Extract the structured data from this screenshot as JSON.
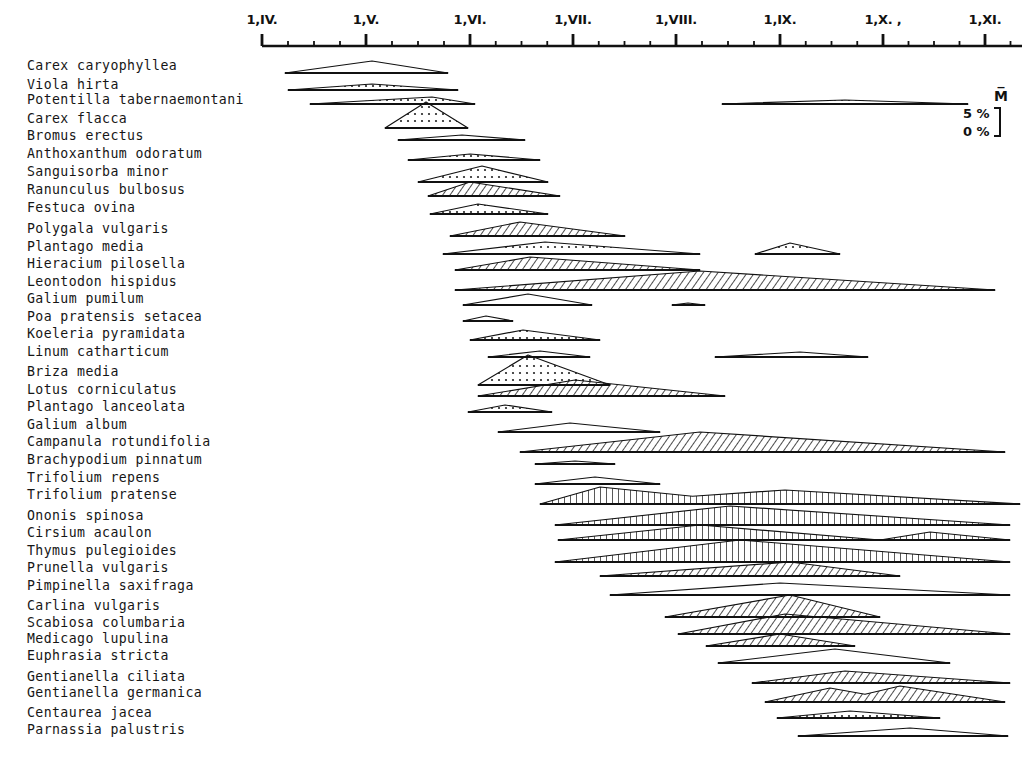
{
  "figure": {
    "kind": "phenology-diagram",
    "axis": {
      "orientation": "horizontal-top",
      "ticks_major": [
        {
          "label": "1,IV.",
          "x": 262
        },
        {
          "label": "1,V.",
          "x": 366
        },
        {
          "label": "1,VI.",
          "x": 470
        },
        {
          "label": "1,VII.",
          "x": 573
        },
        {
          "label": "1,VIII.",
          "x": 676
        },
        {
          "label": "1,IX.",
          "x": 780
        },
        {
          "label": "1,X. ,",
          "x": 883
        },
        {
          "label": "1,XI.",
          "x": 985
        }
      ],
      "minor_ticks_per_month": 3,
      "line_start_x": 262,
      "line_end_x": 1022,
      "line_y": 46
    },
    "legend": {
      "mean_symbol": "M̅",
      "upper_label": "5 %",
      "lower_label": "0 %",
      "bracket_x": 1000,
      "bracket_top": 108,
      "bracket_bottom": 136
    }
  },
  "chart_data": {
    "type": "area",
    "title": "",
    "xlabel": "",
    "ylabel": "",
    "xlim": [
      262,
      1022
    ],
    "x_tick_labels": [
      "1,IV.",
      "1,V.",
      "1,VI.",
      "1,VII.",
      "1,VIII.",
      "1,IX.",
      "1,X. ,",
      "1,XI."
    ],
    "grid": false,
    "legend_position": "top-right",
    "value_unit": "percent cover in flower",
    "ymax_percent": 5,
    "categories": [
      "Carex caryophyllea",
      "Viola hirta",
      "Potentilla tabernaemontani",
      "Carex flacca",
      "Bromus erectus",
      "Anthoxanthum odoratum",
      "Sanguisorba minor",
      "Ranunculus bulbosus",
      "Festuca ovina",
      "Polygala vulgaris",
      "Plantago media",
      "Hieracium pilosella",
      "Leontodon hispidus",
      "Galium pumilum",
      "Poa pratensis setacea",
      "Koeleria pyramidata",
      "Linum catharticum",
      "Briza media",
      "Lotus corniculatus",
      "Plantago lanceolata",
      "Galium album",
      "Campanula rotundifolia",
      "Brachypodium pinnatum",
      "Trifolium repens",
      "Trifolium pratense",
      "Ononis spinosa",
      "Cirsium acaulon",
      "Thymus pulegioides",
      "Prunella vulgaris",
      "Pimpinella saxifraga",
      "Carlina vulgaris",
      "Scabiosa columbaria",
      "Medicago lupulina",
      "Euphrasia stricta",
      "Gentianella ciliata",
      "Gentianella germanica",
      "Centaurea jacea",
      "Parnassia palustris"
    ],
    "series": [
      {
        "name": "Carex caryophyllea",
        "label_y": 65,
        "baseline_y": 73,
        "fill": "light",
        "segments": [
          {
            "x0": 285,
            "x1": 448,
            "peak_x": 372,
            "peak_h": 12
          }
        ]
      },
      {
        "name": "Viola hirta",
        "label_y": 84,
        "baseline_y": 90,
        "fill": "dotted",
        "segments": [
          {
            "x0": 288,
            "x1": 458,
            "peak_x": 372,
            "peak_h": 6
          }
        ]
      },
      {
        "name": "Potentilla tabernaemontani",
        "label_y": 99,
        "baseline_y": 104,
        "fill": "dotted",
        "segments": [
          {
            "x0": 310,
            "x1": 475,
            "peak_x": 432,
            "peak_h": 7
          },
          {
            "x0": 722,
            "x1": 968,
            "peak_x": 845,
            "peak_h": 4
          }
        ]
      },
      {
        "name": "Carex flacca",
        "label_y": 118,
        "baseline_y": 128,
        "fill": "dotted",
        "segments": [
          {
            "x0": 385,
            "x1": 468,
            "peak_x": 426,
            "peak_h": 26
          }
        ]
      },
      {
        "name": "Bromus erectus",
        "label_y": 135,
        "baseline_y": 140,
        "fill": "light",
        "segments": [
          {
            "x0": 398,
            "x1": 525,
            "peak_x": 462,
            "peak_h": 5
          }
        ]
      },
      {
        "name": "Anthoxanthum odoratum",
        "label_y": 153,
        "baseline_y": 160,
        "fill": "dotted",
        "segments": [
          {
            "x0": 408,
            "x1": 540,
            "peak_x": 470,
            "peak_h": 6
          }
        ]
      },
      {
        "name": "Sanguisorba minor",
        "label_y": 171,
        "baseline_y": 182,
        "fill": "dotted",
        "segments": [
          {
            "x0": 418,
            "x1": 548,
            "peak_x": 482,
            "peak_h": 16
          }
        ]
      },
      {
        "name": "Ranunculus bulbosus",
        "label_y": 189,
        "baseline_y": 196,
        "fill": "hatch-right",
        "segments": [
          {
            "x0": 428,
            "x1": 560,
            "peak_x": 470,
            "peak_h": 14
          }
        ]
      },
      {
        "name": "Festuca ovina",
        "label_y": 207,
        "baseline_y": 214,
        "fill": "dotted",
        "segments": [
          {
            "x0": 430,
            "x1": 548,
            "peak_x": 478,
            "peak_h": 10
          }
        ]
      },
      {
        "name": "Polygala vulgaris",
        "label_y": 228,
        "baseline_y": 236,
        "fill": "hatch-right",
        "segments": [
          {
            "x0": 450,
            "x1": 625,
            "peak_x": 520,
            "peak_h": 14
          }
        ]
      },
      {
        "name": "Plantago media",
        "label_y": 246,
        "baseline_y": 254,
        "fill": "dotted",
        "segments": [
          {
            "x0": 443,
            "x1": 700,
            "peak_x": 545,
            "peak_h": 12
          },
          {
            "x0": 755,
            "x1": 840,
            "peak_x": 790,
            "peak_h": 11
          }
        ]
      },
      {
        "name": "Hieracium pilosella",
        "label_y": 263,
        "baseline_y": 270,
        "fill": "hatch-right",
        "segments": [
          {
            "x0": 455,
            "x1": 700,
            "peak_x": 530,
            "peak_h": 13
          }
        ]
      },
      {
        "name": "Leontodon hispidus",
        "label_y": 281,
        "baseline_y": 290,
        "fill": "hatch-right",
        "segments": [
          {
            "x0": 455,
            "x1": 995,
            "peak_x": 700,
            "peak_h": 19
          }
        ]
      },
      {
        "name": "Galium pumilum",
        "label_y": 298,
        "baseline_y": 305,
        "fill": "light",
        "segments": [
          {
            "x0": 463,
            "x1": 592,
            "peak_x": 528,
            "peak_h": 11
          },
          {
            "x0": 672,
            "x1": 705,
            "peak_x": 688,
            "peak_h": 2
          }
        ]
      },
      {
        "name": "Poa pratensis setacea",
        "label_y": 316,
        "baseline_y": 321,
        "fill": "light",
        "segments": [
          {
            "x0": 463,
            "x1": 513,
            "peak_x": 486,
            "peak_h": 5
          }
        ]
      },
      {
        "name": "Koeleria pyramidata",
        "label_y": 333,
        "baseline_y": 340,
        "fill": "dotted",
        "segments": [
          {
            "x0": 470,
            "x1": 600,
            "peak_x": 523,
            "peak_h": 10
          }
        ]
      },
      {
        "name": "Linum catharticum",
        "label_y": 351,
        "baseline_y": 357,
        "fill": "light",
        "segments": [
          {
            "x0": 488,
            "x1": 590,
            "peak_x": 540,
            "peak_h": 6
          },
          {
            "x0": 715,
            "x1": 868,
            "peak_x": 800,
            "peak_h": 5
          }
        ]
      },
      {
        "name": "Briza media",
        "label_y": 371,
        "baseline_y": 385,
        "fill": "dotted",
        "segments": [
          {
            "x0": 478,
            "x1": 610,
            "peak_x": 528,
            "peak_h": 30
          }
        ]
      },
      {
        "name": "Lotus corniculatus",
        "label_y": 389,
        "baseline_y": 396,
        "fill": "hatch-right",
        "segments": [
          {
            "x0": 478,
            "x1": 725,
            "peak_x": 575,
            "peak_h": 16
          }
        ]
      },
      {
        "name": "Plantago lanceolata",
        "label_y": 406,
        "baseline_y": 412,
        "fill": "dotted",
        "segments": [
          {
            "x0": 468,
            "x1": 552,
            "peak_x": 505,
            "peak_h": 7
          }
        ]
      },
      {
        "name": "Galium album",
        "label_y": 424,
        "baseline_y": 432,
        "fill": "light",
        "segments": [
          {
            "x0": 498,
            "x1": 660,
            "peak_x": 570,
            "peak_h": 9
          }
        ]
      },
      {
        "name": "Campanula rotundifolia",
        "label_y": 441,
        "baseline_y": 452,
        "fill": "hatch-right",
        "segments": [
          {
            "x0": 520,
            "x1": 1005,
            "peak_x": 700,
            "peak_h": 20
          }
        ]
      },
      {
        "name": "Brachypodium pinnatum",
        "label_y": 459,
        "baseline_y": 464,
        "fill": "light",
        "segments": [
          {
            "x0": 535,
            "x1": 615,
            "peak_x": 575,
            "peak_h": 3
          }
        ]
      },
      {
        "name": "Trifolium repens",
        "label_y": 477,
        "baseline_y": 484,
        "fill": "light",
        "segments": [
          {
            "x0": 535,
            "x1": 660,
            "peak_x": 595,
            "peak_h": 7
          }
        ]
      },
      {
        "name": "Trifolium pratense",
        "label_y": 494,
        "baseline_y": 504,
        "fill": "hatch-vert",
        "segments": [
          {
            "x0": 540,
            "x1": 1020,
            "peak_x": 600,
            "peak_h": 17
          },
          {
            "x0": 540,
            "x1": 1020,
            "peak_x": 785,
            "peak_h": 14
          }
        ]
      },
      {
        "name": "Ononis spinosa",
        "label_y": 515,
        "baseline_y": 525,
        "fill": "hatch-vert",
        "segments": [
          {
            "x0": 555,
            "x1": 1010,
            "peak_x": 730,
            "peak_h": 19
          }
        ]
      },
      {
        "name": "Cirsium acaulon",
        "label_y": 532,
        "baseline_y": 540,
        "fill": "hatch-vert",
        "segments": [
          {
            "x0": 558,
            "x1": 880,
            "peak_x": 700,
            "peak_h": 15
          },
          {
            "x0": 880,
            "x1": 1010,
            "peak_x": 930,
            "peak_h": 8
          }
        ]
      },
      {
        "name": "Thymus pulegioides",
        "label_y": 550,
        "baseline_y": 562,
        "fill": "hatch-vert",
        "segments": [
          {
            "x0": 555,
            "x1": 1010,
            "peak_x": 740,
            "peak_h": 22
          }
        ]
      },
      {
        "name": "Prunella vulgaris",
        "label_y": 567,
        "baseline_y": 576,
        "fill": "hatch-right",
        "segments": [
          {
            "x0": 600,
            "x1": 900,
            "peak_x": 790,
            "peak_h": 14
          }
        ]
      },
      {
        "name": "Pimpinella saxifraga",
        "label_y": 585,
        "baseline_y": 595,
        "fill": "light",
        "segments": [
          {
            "x0": 610,
            "x1": 1010,
            "peak_x": 780,
            "peak_h": 12
          }
        ]
      },
      {
        "name": "Carlina vulgaris",
        "label_y": 605,
        "baseline_y": 617,
        "fill": "hatch-right",
        "segments": [
          {
            "x0": 665,
            "x1": 880,
            "peak_x": 790,
            "peak_h": 22
          }
        ]
      },
      {
        "name": "Scabiosa columbaria",
        "label_y": 622,
        "baseline_y": 634,
        "fill": "hatch-right",
        "segments": [
          {
            "x0": 678,
            "x1": 1010,
            "peak_x": 785,
            "peak_h": 20
          }
        ]
      },
      {
        "name": "Medicago lupulina",
        "label_y": 638,
        "baseline_y": 646,
        "fill": "hatch-right",
        "segments": [
          {
            "x0": 706,
            "x1": 855,
            "peak_x": 780,
            "peak_h": 12
          }
        ]
      },
      {
        "name": "Euphrasia stricta",
        "label_y": 655,
        "baseline_y": 663,
        "fill": "light",
        "segments": [
          {
            "x0": 718,
            "x1": 950,
            "peak_x": 835,
            "peak_h": 14
          }
        ]
      },
      {
        "name": "Gentianella ciliata",
        "label_y": 676,
        "baseline_y": 683,
        "fill": "hatch-right",
        "segments": [
          {
            "x0": 752,
            "x1": 1010,
            "peak_x": 845,
            "peak_h": 12
          }
        ]
      },
      {
        "name": "Gentianella germanica",
        "label_y": 692,
        "baseline_y": 702,
        "fill": "hatch-right",
        "segments": [
          {
            "x0": 765,
            "x1": 1005,
            "peak_x": 830,
            "peak_h": 14
          },
          {
            "x0": 765,
            "x1": 1005,
            "peak_x": 900,
            "peak_h": 16
          }
        ]
      },
      {
        "name": "Centaurea jacea",
        "label_y": 712,
        "baseline_y": 718,
        "fill": "dotted",
        "segments": [
          {
            "x0": 777,
            "x1": 940,
            "peak_x": 850,
            "peak_h": 7
          }
        ]
      },
      {
        "name": "Parnassia palustris",
        "label_y": 729,
        "baseline_y": 736,
        "fill": "light",
        "segments": [
          {
            "x0": 798,
            "x1": 1008,
            "peak_x": 910,
            "peak_h": 8
          }
        ]
      }
    ]
  }
}
